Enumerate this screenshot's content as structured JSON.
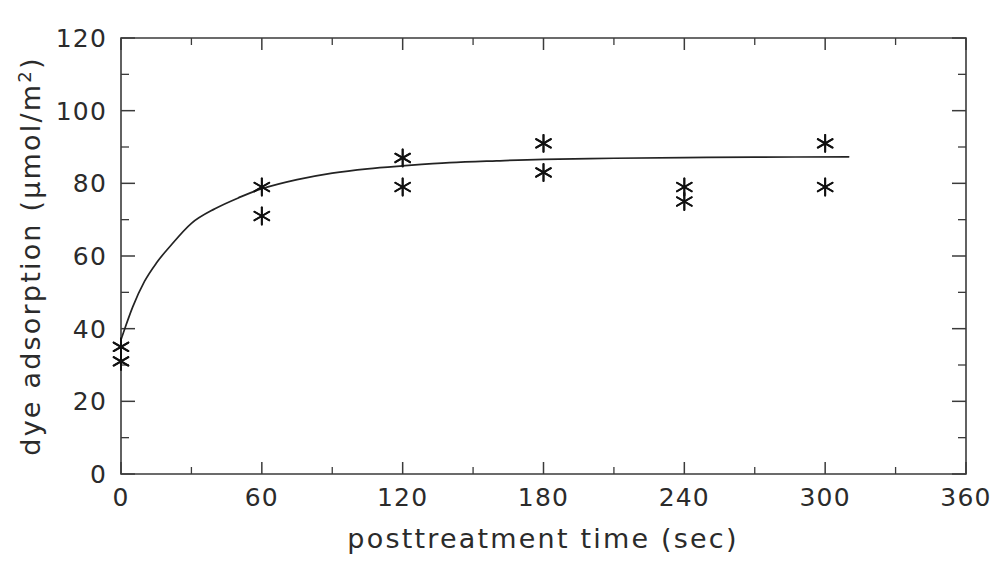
{
  "chart_data": {
    "type": "scatter",
    "title": "",
    "xlabel": "posttreatment  time  (sec)",
    "ylabel_main": "dye  adsorption  (μmol/m",
    "ylabel_sup": "2",
    "ylabel_tail": ")",
    "ylabel_full": "dye adsorption (μmol/m2)",
    "xlim": [
      0,
      360
    ],
    "ylim": [
      0,
      120
    ],
    "x_major_ticks": [
      0,
      60,
      120,
      180,
      240,
      300,
      360
    ],
    "x_minor_ticks": [
      30,
      90,
      150,
      210,
      270,
      330
    ],
    "y_major_ticks": [
      0,
      20,
      40,
      60,
      80,
      100,
      120
    ],
    "y_minor_ticks": [
      10,
      30,
      50,
      70,
      90,
      110
    ],
    "x_tick_labels": [
      "0",
      "60",
      "120",
      "180",
      "240",
      "300",
      "360"
    ],
    "y_tick_labels": [
      "0",
      "20",
      "40",
      "60",
      "80",
      "100",
      "120"
    ],
    "grid": false,
    "legend": false,
    "marker_style": "asterisk",
    "series": [
      {
        "name": "dye adsorption measurements",
        "marker": "asterisk",
        "points": [
          {
            "x": 0,
            "y": 35
          },
          {
            "x": 0,
            "y": 31
          },
          {
            "x": 60,
            "y": 79
          },
          {
            "x": 60,
            "y": 71
          },
          {
            "x": 120,
            "y": 87
          },
          {
            "x": 120,
            "y": 79
          },
          {
            "x": 180,
            "y": 91
          },
          {
            "x": 180,
            "y": 83
          },
          {
            "x": 240,
            "y": 79
          },
          {
            "x": 240,
            "y": 75
          },
          {
            "x": 300,
            "y": 91
          },
          {
            "x": 300,
            "y": 79
          }
        ]
      },
      {
        "name": "fitted saturation curve",
        "marker": "line",
        "points": [
          {
            "x": 0,
            "y": 37
          },
          {
            "x": 5,
            "y": 46
          },
          {
            "x": 10,
            "y": 53
          },
          {
            "x": 15,
            "y": 58
          },
          {
            "x": 20,
            "y": 62
          },
          {
            "x": 30,
            "y": 69
          },
          {
            "x": 40,
            "y": 73
          },
          {
            "x": 50,
            "y": 76
          },
          {
            "x": 60,
            "y": 78.5
          },
          {
            "x": 75,
            "y": 81
          },
          {
            "x": 90,
            "y": 82.8
          },
          {
            "x": 105,
            "y": 84
          },
          {
            "x": 120,
            "y": 84.8
          },
          {
            "x": 140,
            "y": 85.7
          },
          {
            "x": 160,
            "y": 86.2
          },
          {
            "x": 180,
            "y": 86.6
          },
          {
            "x": 210,
            "y": 86.9
          },
          {
            "x": 240,
            "y": 87.1
          },
          {
            "x": 270,
            "y": 87.2
          },
          {
            "x": 310,
            "y": 87.3
          }
        ]
      }
    ]
  }
}
